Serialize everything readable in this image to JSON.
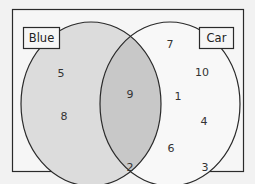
{
  "diagram": {
    "type": "venn",
    "sets": [
      {
        "name": "Blue",
        "fill": "#dcdcdc",
        "only_values": [
          "5",
          "8"
        ]
      },
      {
        "name": "Car",
        "fill": "#f8f8f8",
        "only_values": [
          "7",
          "10",
          "1",
          "4",
          "6"
        ]
      }
    ],
    "intersection": {
      "fill": "#c8c8c8",
      "values": [
        "9"
      ]
    },
    "outside": {
      "values": [
        "2",
        "3"
      ]
    },
    "labels": {
      "blue": "Blue",
      "car": "Car"
    },
    "numbers": {
      "blue_5": "5",
      "blue_8": "8",
      "both_9": "9",
      "car_7": "7",
      "car_10": "10",
      "car_1": "1",
      "car_4": "4",
      "car_6": "6",
      "out_2": "2",
      "out_3": "3"
    },
    "colors": {
      "background": "#f2f2f2",
      "frame_fill": "#f6f6f6",
      "stroke": "#2a2a2a"
    }
  }
}
